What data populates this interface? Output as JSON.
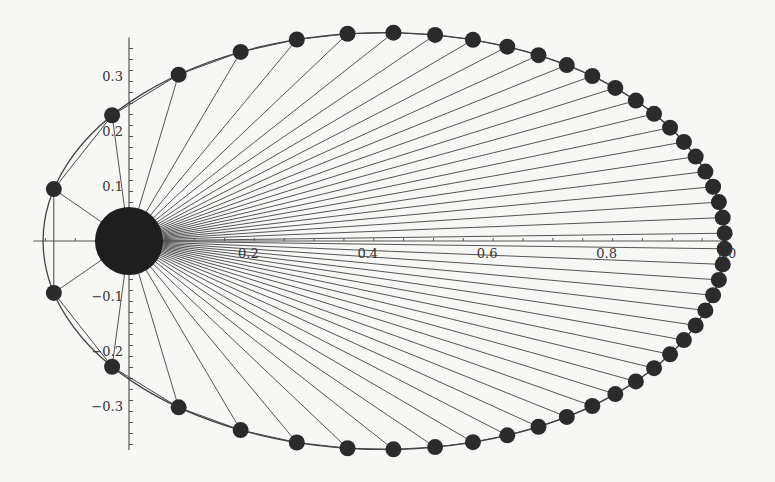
{
  "chart_data": {
    "type": "scatter",
    "title": "",
    "xlabel": "",
    "ylabel": "",
    "xlim": [
      -0.16,
      1.02
    ],
    "ylim": [
      -0.39,
      0.39
    ],
    "grid": false,
    "legend": null,
    "x_ticks": [
      {
        "value": 0.2,
        "label": "0.2"
      },
      {
        "value": 0.4,
        "label": "0.4"
      },
      {
        "value": 0.6,
        "label": "0.6"
      },
      {
        "value": 0.8,
        "label": "0.8"
      },
      {
        "value": 1.0,
        "label": "1.0"
      }
    ],
    "y_ticks": [
      {
        "value": 0.3,
        "label": "0.3"
      },
      {
        "value": 0.2,
        "label": "0.2"
      },
      {
        "value": 0.1,
        "label": "0.1"
      },
      {
        "value": -0.1,
        "label": "-0.1"
      },
      {
        "value": -0.2,
        "label": "-0.2"
      },
      {
        "value": -0.3,
        "label": "-0.3"
      }
    ],
    "orbit": {
      "semi_major_axis": 0.571,
      "eccentricity": 0.748,
      "perihelion_x": -0.144,
      "aphelion_x": 0.998,
      "semi_minor_axis": 0.379,
      "num_positions": 48
    },
    "sun": {
      "x": 0,
      "y": 0,
      "radius": 0.057
    },
    "colors": {
      "background": "#f7f7f5",
      "axis": "#555555",
      "orbit": "#444444",
      "radius_lines": "#555555",
      "planet": "#2b2b2b",
      "sun": "#1e1e1e"
    }
  }
}
